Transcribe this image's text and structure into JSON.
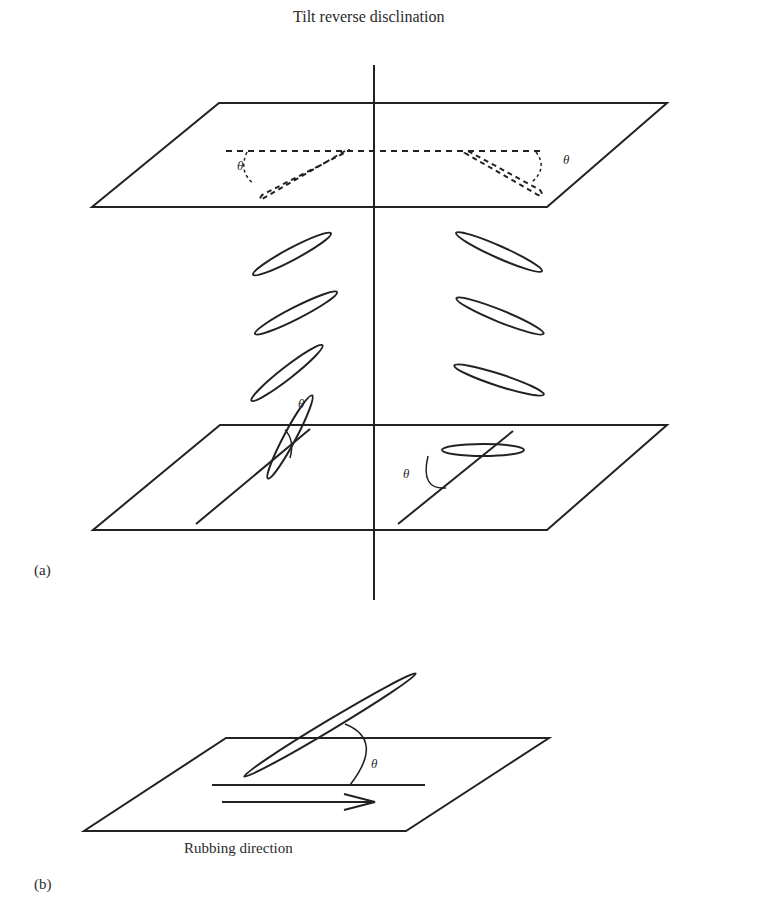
{
  "figure": {
    "title": "Tilt reverse disclination",
    "panels": [
      {
        "id": "a",
        "label": "(a)",
        "angle_labels": [
          "θ",
          "θ",
          "θ",
          "θ"
        ]
      },
      {
        "id": "b",
        "label": "(b)",
        "caption": "Rubbing direction",
        "angle_labels": [
          "θ"
        ]
      }
    ],
    "theta": "θ"
  },
  "colors": {
    "stroke": "#222222",
    "background": "#ffffff"
  }
}
